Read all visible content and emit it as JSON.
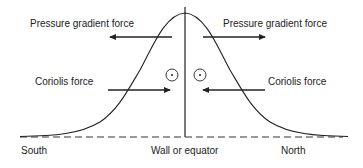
{
  "labels": {
    "pgf_left": "Pressure gradient force",
    "pgf_right": "Pressure gradient force",
    "coriolis_left": "Coriolis force",
    "coriolis_right": "Coriolis force",
    "south": "South",
    "wall": "Wall or equator",
    "north": "North"
  },
  "symbols": {
    "left_circle": "out-of-page-symbol",
    "right_circle": "out-of-page-symbol"
  },
  "colors": {
    "line": "#222222",
    "background": "#ffffff"
  }
}
